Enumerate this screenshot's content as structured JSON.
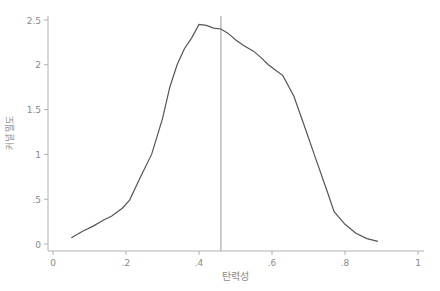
{
  "chart_data": {
    "type": "line",
    "title": "",
    "xlabel": "탄력성",
    "ylabel": "커널 밀도",
    "xlim": [
      0,
      1
    ],
    "ylim": [
      0,
      2.5
    ],
    "grid": false,
    "legend": null,
    "xticks": [
      0,
      0.2,
      0.4,
      0.6,
      0.8,
      1
    ],
    "xtick_labels": [
      "0",
      ".2",
      ".4",
      ".6",
      ".8",
      "1"
    ],
    "yticks": [
      0,
      0.5,
      1,
      1.5,
      2,
      2.5
    ],
    "ytick_labels": [
      "0",
      ".5",
      "1",
      "1.5",
      "2",
      "2.5"
    ],
    "reference_line": {
      "orientation": "vertical",
      "x": 0.46
    },
    "series": [
      {
        "name": "density",
        "x": [
          0.05,
          0.08,
          0.11,
          0.14,
          0.16,
          0.19,
          0.21,
          0.24,
          0.27,
          0.3,
          0.32,
          0.34,
          0.36,
          0.38,
          0.4,
          0.42,
          0.44,
          0.46,
          0.48,
          0.5,
          0.52,
          0.55,
          0.57,
          0.59,
          0.61,
          0.63,
          0.66,
          0.69,
          0.72,
          0.75,
          0.77,
          0.8,
          0.83,
          0.86,
          0.89
        ],
        "y": [
          0.07,
          0.14,
          0.2,
          0.27,
          0.31,
          0.4,
          0.49,
          0.75,
          1.0,
          1.4,
          1.75,
          2.0,
          2.18,
          2.3,
          2.45,
          2.44,
          2.41,
          2.4,
          2.35,
          2.28,
          2.22,
          2.15,
          2.08,
          2.0,
          1.94,
          1.88,
          1.65,
          1.3,
          0.95,
          0.6,
          0.36,
          0.22,
          0.12,
          0.06,
          0.03
        ]
      }
    ]
  }
}
